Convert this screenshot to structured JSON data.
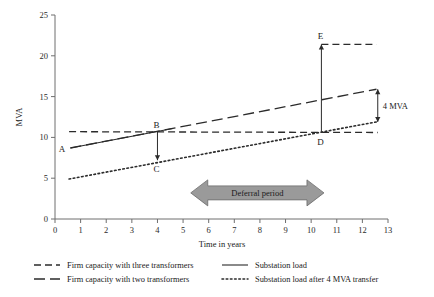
{
  "chart_data": {
    "type": "line",
    "title": "",
    "xlabel": "Time in years",
    "ylabel": "MVA",
    "xlim": [
      0,
      13
    ],
    "ylim": [
      0,
      25
    ],
    "xticks": [
      0,
      1,
      2,
      3,
      4,
      5,
      6,
      7,
      8,
      9,
      10,
      11,
      12,
      13
    ],
    "yticks": [
      0,
      5,
      10,
      15,
      20,
      25
    ],
    "grid": false,
    "legend_position": "below",
    "series": [
      {
        "name": "Firm capacity with three transformers",
        "style": "dashed",
        "x": [
          0.55,
          12.6
        ],
        "values": [
          10.7,
          10.6
        ]
      },
      {
        "name": "Firm capacity with two transformers",
        "style": "long-dash",
        "x": [
          0.6,
          12.55
        ],
        "values": [
          8.7,
          15.9
        ]
      },
      {
        "name": "Substation load",
        "style": "solid",
        "x": [
          0.6,
          4.6
        ],
        "values": [
          8.7,
          11.1
        ]
      },
      {
        "name": "Substation load after 4 MVA transfer",
        "style": "dotted",
        "x": [
          0.55,
          12.55
        ],
        "values": [
          4.9,
          11.9
        ]
      }
    ],
    "annotations": [
      {
        "label": "A",
        "x": 0.62,
        "y": 8.7,
        "note": "start of substation load"
      },
      {
        "label": "B",
        "x": 4.0,
        "y": 10.7,
        "note": "load meets three-transformer firm capacity"
      },
      {
        "label": "C",
        "x": 4.0,
        "y": 7.2,
        "note": "load after 4 MVA transfer"
      },
      {
        "label": "D",
        "x": 10.4,
        "y": 10.6,
        "note": "transferred load meets firm capacity"
      },
      {
        "label": "E",
        "x": 10.4,
        "y": 21.4,
        "note": "projected load without transfer"
      }
    ],
    "measure_annotations": [
      {
        "label": "4 MVA",
        "x": 12.6,
        "y_from": 15.9,
        "y_to": 11.9
      }
    ],
    "band": {
      "label": "Deferral period",
      "x_start": 5.3,
      "x_end": 10.5,
      "y": 3.2,
      "color": "#9a9a9a"
    },
    "reference_line": {
      "from_x": 10.4,
      "to_x": 12.55,
      "y": 21.4,
      "style": "dashed"
    },
    "legend": [
      {
        "label": "Firm capacity with three transformers",
        "style": "dashed",
        "column": 1,
        "row": 1
      },
      {
        "label": "Firm capacity with two transformers",
        "style": "long-dash",
        "column": 1,
        "row": 2
      },
      {
        "label": "Substation load",
        "style": "solid",
        "column": 2,
        "row": 1
      },
      {
        "label": "Substation load after 4 MVA transfer",
        "style": "dotted",
        "column": 2,
        "row": 2
      }
    ]
  }
}
